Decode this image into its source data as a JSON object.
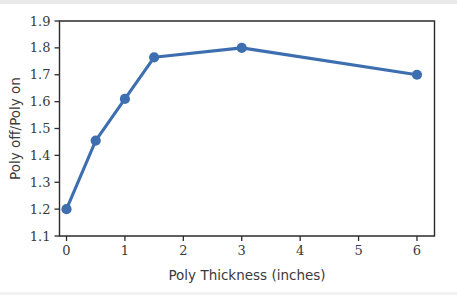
{
  "figure": {
    "background_color": "#ffffff",
    "edge_strip_color": "#e9e9e9"
  },
  "chart_data": {
    "type": "line",
    "title": "",
    "xlabel": "Poly Thickness (inches)",
    "ylabel": "Poly off/Poly on",
    "xlim": [
      -0.12,
      6.3
    ],
    "ylim": [
      1.1,
      1.9
    ],
    "xticks": [
      "0",
      "1",
      "2",
      "3",
      "4",
      "5",
      "6"
    ],
    "xtick_values": [
      0,
      1,
      2,
      3,
      4,
      5,
      6
    ],
    "yticks": [
      "1.1",
      "1.2",
      "1.3",
      "1.4",
      "1.5",
      "1.6",
      "1.7",
      "1.8",
      "1.9"
    ],
    "ytick_values": [
      1.1,
      1.2,
      1.3,
      1.4,
      1.5,
      1.6,
      1.7,
      1.8,
      1.9
    ],
    "grid": false,
    "legend": false,
    "legend_position": "none",
    "series": [
      {
        "name": "Poly off/Poly on",
        "color": "#3d6fb0",
        "marker": "circle",
        "x": [
          0,
          0.5,
          1,
          1.5,
          3,
          6
        ],
        "values": [
          1.2,
          1.455,
          1.61,
          1.765,
          1.8,
          1.7
        ]
      }
    ]
  }
}
